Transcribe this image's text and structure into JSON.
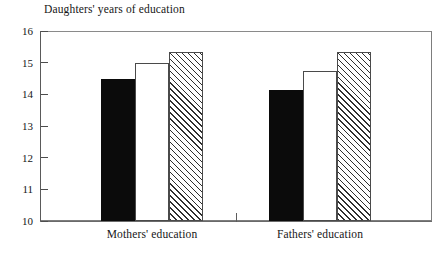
{
  "chart_data": {
    "type": "bar",
    "title": "Daughters' years of education",
    "xlabel": "",
    "ylabel": "",
    "ylim": [
      10,
      16
    ],
    "yticks": [
      10,
      11,
      12,
      13,
      14,
      15,
      16
    ],
    "ytick_labels": [
      "10",
      "11",
      "12",
      "13",
      "14",
      "15",
      "16"
    ],
    "grid": false,
    "legend": "none",
    "categories": [
      "Mothers' education",
      "Fathers' education"
    ],
    "series": [
      {
        "name": "bar-1-solid-black",
        "fill": "solid",
        "color": "#0b0b0b",
        "values": [
          14.5,
          14.15
        ]
      },
      {
        "name": "bar-2-open-white",
        "fill": "open",
        "color": "#ffffff",
        "values": [
          15.0,
          14.75
        ]
      },
      {
        "name": "bar-3-hatched",
        "fill": "hatched",
        "color": "#ffffff",
        "values": [
          15.35,
          15.35
        ]
      }
    ]
  },
  "colors": {
    "solid_bar": "#0b0b0b",
    "open_bar": "#ffffff",
    "hatch_line": "#2e2e2e",
    "axis": "#5a5a5a",
    "text": "#161616",
    "background": "#ffffff"
  }
}
